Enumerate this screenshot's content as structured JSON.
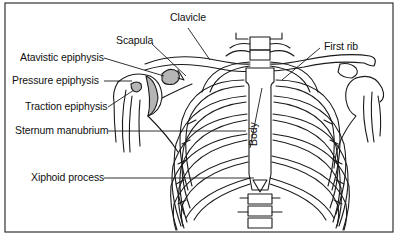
{
  "diagram": {
    "labels": {
      "clavicle": "Clavicle",
      "scapula": "Scapula",
      "first_rib": "First rib",
      "atavistic_epiphysis": "Atavistic epiphysis",
      "pressure_epiphysis": "Pressure epiphysis",
      "traction_epiphysis": "Traction epiphysis",
      "sternum_manubrium": "Sternum manubrium",
      "body": "Body",
      "xiphoid_process": "Xiphoid process"
    },
    "colors": {
      "line": "#1a1a1a",
      "shaded_epiphysis": "#b5b5b5",
      "background": "#ffffff",
      "frame": "#333333"
    }
  }
}
